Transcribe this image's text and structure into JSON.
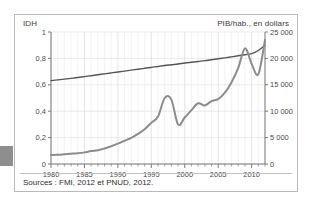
{
  "figure": {
    "header_left": "IDH",
    "header_right": "PIB/hab., en dollars",
    "sources": "Sources : FMI, 2012 et PNUD, 2012."
  },
  "chart_data": {
    "type": "line",
    "title": "",
    "xlabel": "",
    "ylabel": "IDH",
    "y2label": "PIB/hab., en dollars",
    "grid": true,
    "legend": "none",
    "xlim": [
      1980,
      2012
    ],
    "ylim": [
      0,
      1
    ],
    "y2lim": [
      0,
      25000
    ],
    "xticks": [
      1980,
      1985,
      1990,
      1995,
      2000,
      2005,
      2010
    ],
    "xticklabels": [
      "1980",
      "1985",
      "1990",
      "1995",
      "2000",
      "2005",
      "2010"
    ],
    "yticks": [
      0,
      0.2,
      0.4,
      0.6,
      0.8,
      1
    ],
    "yticklabels": [
      "0",
      "0,2",
      "0,4",
      "0,6",
      "0,8",
      "1"
    ],
    "y2ticks": [
      0,
      5000,
      10000,
      15000,
      20000,
      25000
    ],
    "y2ticklabels": [
      "0",
      "5 000",
      "10 000",
      "15 000",
      "20 000",
      "25 000"
    ],
    "x": [
      1980,
      1981,
      1982,
      1983,
      1984,
      1985,
      1986,
      1987,
      1988,
      1989,
      1990,
      1991,
      1992,
      1993,
      1994,
      1995,
      1996,
      1997,
      1998,
      1999,
      2000,
      2001,
      2002,
      2003,
      2004,
      2005,
      2006,
      2007,
      2008,
      2009,
      2010,
      2011,
      2012
    ],
    "series": [
      {
        "name": "IDH",
        "axis": "left",
        "color": "#555555",
        "values": [
          0.632,
          0.637,
          0.643,
          0.649,
          0.655,
          0.662,
          0.669,
          0.676,
          0.683,
          0.69,
          0.697,
          0.704,
          0.711,
          0.718,
          0.725,
          0.732,
          0.739,
          0.746,
          0.752,
          0.758,
          0.765,
          0.771,
          0.777,
          0.783,
          0.79,
          0.797,
          0.804,
          0.812,
          0.82,
          0.828,
          0.836,
          0.86,
          0.9
        ]
      },
      {
        "name": "PIB/hab., en dollars",
        "axis": "right",
        "color": "#8c8c8c",
        "values": [
          1700,
          1750,
          1850,
          1950,
          2050,
          2200,
          2450,
          2600,
          2950,
          3350,
          3850,
          4400,
          4950,
          5700,
          6600,
          7800,
          9000,
          12500,
          12200,
          7500,
          8800,
          10200,
          11500,
          11100,
          11900,
          12300,
          13500,
          15500,
          18200,
          21900,
          19000,
          17000,
          23500
        ]
      }
    ],
    "annotations": []
  }
}
